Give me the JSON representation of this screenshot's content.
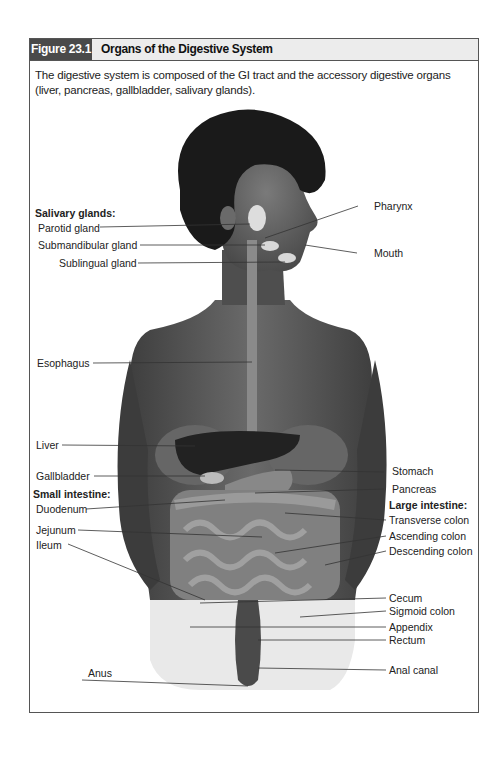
{
  "figure": {
    "number": "Figure 23.1",
    "title": "Organs of the Digestive System",
    "caption": "The digestive system is composed of the GI tract and the accessory digestive organs (liver, pancreas, gallbladder, salivary glands)."
  },
  "labels": {
    "left": {
      "salivary_heading": "Salivary glands:",
      "parotid": "Parotid gland",
      "submandibular": "Submandibular gland",
      "sublingual": "Sublingual gland",
      "esophagus": "Esophagus",
      "liver": "Liver",
      "gallbladder": "Gallbladder",
      "small_intestine_heading": "Small intestine:",
      "duodenum": "Duodenum",
      "jejunum": "Jejunum",
      "ileum": "Ileum",
      "anus": "Anus"
    },
    "right": {
      "pharynx": "Pharynx",
      "mouth": "Mouth",
      "stomach": "Stomach",
      "pancreas": "Pancreas",
      "large_intestine_heading": "Large intestine:",
      "transverse_colon": "Transverse colon",
      "ascending_colon": "Ascending colon",
      "descending_colon": "Descending colon",
      "cecum": "Cecum",
      "sigmoid_colon": "Sigmoid colon",
      "appendix": "Appendix",
      "rectum": "Rectum",
      "anal_canal": "Anal canal"
    }
  },
  "colors": {
    "frame": "#555555",
    "header_dark": "#4a4a4a",
    "header_light": "#ececec",
    "body": "#5a5a5a",
    "hair": "#1a1a1a"
  }
}
